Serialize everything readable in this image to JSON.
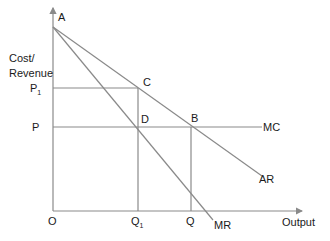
{
  "diagram": {
    "type": "monopoly price-output (cost/revenue) diagram",
    "axes": {
      "y_label_line1": "Cost/",
      "y_label_line2": "Revenue",
      "x_label": "Output",
      "origin_label": "O"
    },
    "price_labels": {
      "p1_main": "P",
      "p1_sub": "1",
      "p_main": "P"
    },
    "quantity_labels": {
      "q1_main": "Q",
      "q1_sub": "1",
      "q_main": "Q"
    },
    "points": {
      "a": "A",
      "b": "B",
      "c": "C",
      "d": "D"
    },
    "curves": {
      "mc": "MC",
      "ar": "AR",
      "mr": "MR"
    },
    "colors": {
      "line": "#8a8a8a",
      "text": "#1a1a1a",
      "background": "#ffffff"
    }
  }
}
